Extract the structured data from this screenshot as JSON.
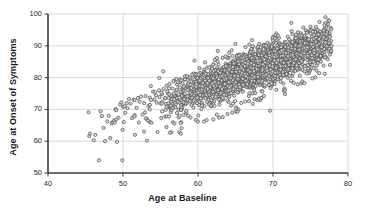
{
  "chart_data": {
    "type": "scatter",
    "title": "",
    "xlabel": "Age at Baseline",
    "ylabel": "Age at Onset of Symptoms",
    "xlim": [
      40,
      80
    ],
    "ylim": [
      50,
      100
    ],
    "xticks": [
      40,
      50,
      60,
      70,
      80
    ],
    "yticks": [
      50,
      60,
      70,
      80,
      90,
      100
    ],
    "grid": true,
    "legend": null,
    "marker": {
      "shape": "circle-open",
      "size_px": 3.2,
      "edge_color": "#555555",
      "fill_color": "#d8d8d8",
      "opacity": 0.85
    },
    "n_points": 2600,
    "point_cloud": {
      "x_range_observed": [
        45.0,
        77.8
      ],
      "y_range_observed": [
        54.0,
        99.2
      ],
      "correlation": 0.86,
      "dense_core_x": [
        57,
        77
      ],
      "dense_core_y": [
        74,
        96
      ]
    },
    "points": [
      [
        45.4,
        69.1
      ],
      [
        45.5,
        61.6
      ],
      [
        45.6,
        62.4
      ],
      [
        46.1,
        60.3
      ],
      [
        46.3,
        62.0
      ],
      [
        46.8,
        54.0
      ],
      [
        47.0,
        69.4
      ],
      [
        47.2,
        67.9
      ],
      [
        47.4,
        64.2
      ],
      [
        47.6,
        60.0
      ],
      [
        47.9,
        66.2
      ],
      [
        48.1,
        68.0
      ],
      [
        48.3,
        61.0
      ],
      [
        48.5,
        65.6
      ],
      [
        48.6,
        66.0
      ],
      [
        48.8,
        66.5
      ],
      [
        48.9,
        65.9
      ],
      [
        49.0,
        70.1
      ],
      [
        49.1,
        66.8
      ],
      [
        49.2,
        59.8
      ],
      [
        49.4,
        67.4
      ],
      [
        49.6,
        71.6
      ],
      [
        49.8,
        72.2
      ],
      [
        49.9,
        54.0
      ],
      [
        50.0,
        70.8
      ],
      [
        50.1,
        66.0
      ],
      [
        50.2,
        71.0
      ],
      [
        50.3,
        68.9
      ],
      [
        50.5,
        72.0
      ],
      [
        50.6,
        70.4
      ],
      [
        50.8,
        73.3
      ],
      [
        51.0,
        71.8
      ],
      [
        51.2,
        67.3
      ],
      [
        51.4,
        73.0
      ],
      [
        51.6,
        62.0
      ],
      [
        51.8,
        70.5
      ],
      [
        52.0,
        73.6
      ],
      [
        52.2,
        72.4
      ],
      [
        52.4,
        74.0
      ],
      [
        52.6,
        68.4
      ],
      [
        52.8,
        63.0
      ],
      [
        53.0,
        74.2
      ],
      [
        53.2,
        60.2
      ],
      [
        53.4,
        71.1
      ],
      [
        53.6,
        66.0
      ],
      [
        53.8,
        65.8
      ],
      [
        54.0,
        75.6
      ],
      [
        54.2,
        73.1
      ],
      [
        54.4,
        74.4
      ],
      [
        54.6,
        62.9
      ],
      [
        54.8,
        76.0
      ],
      [
        55.0,
        71.9
      ],
      [
        55.2,
        74.8
      ],
      [
        55.4,
        76.4
      ],
      [
        55.6,
        73.5
      ],
      [
        55.8,
        77.5
      ],
      [
        56.0,
        75.0
      ],
      [
        56.2,
        78.0
      ],
      [
        56.4,
        72.4
      ],
      [
        56.6,
        76.6
      ],
      [
        56.8,
        79.0
      ],
      [
        57.0,
        74.2
      ],
      [
        57.2,
        77.8
      ],
      [
        57.4,
        67.5
      ],
      [
        57.6,
        78.6
      ],
      [
        57.8,
        64.1
      ],
      [
        58.0,
        76.1
      ],
      [
        58.2,
        79.4
      ],
      [
        58.4,
        69.0
      ],
      [
        58.6,
        77.2
      ],
      [
        58.8,
        80.0
      ],
      [
        59.0,
        75.4
      ],
      [
        59.2,
        78.2
      ],
      [
        59.4,
        70.6
      ],
      [
        59.6,
        80.6
      ],
      [
        59.8,
        76.8
      ],
      [
        60.0,
        79.5
      ],
      [
        60.4,
        81.2
      ],
      [
        60.8,
        77.4
      ],
      [
        61.2,
        80.2
      ],
      [
        61.6,
        72.0
      ],
      [
        62.0,
        81.8
      ],
      [
        62.4,
        78.6
      ],
      [
        62.8,
        67.4
      ],
      [
        63.2,
        82.4
      ],
      [
        63.6,
        79.8
      ],
      [
        64.0,
        83.0
      ],
      [
        64.4,
        71.2
      ],
      [
        64.8,
        81.0
      ],
      [
        65.2,
        84.0
      ],
      [
        65.6,
        80.4
      ],
      [
        66.0,
        84.6
      ],
      [
        66.4,
        82.0
      ],
      [
        66.8,
        72.6
      ],
      [
        67.2,
        85.2
      ],
      [
        67.6,
        83.0
      ],
      [
        68.0,
        86.0
      ],
      [
        68.4,
        73.4
      ],
      [
        68.8,
        84.2
      ],
      [
        69.2,
        86.8
      ],
      [
        69.6,
        69.6
      ],
      [
        70.0,
        87.4
      ],
      [
        70.4,
        85.0
      ],
      [
        70.8,
        88.0
      ],
      [
        71.2,
        86.2
      ],
      [
        71.6,
        74.8
      ],
      [
        72.0,
        89.0
      ],
      [
        72.4,
        87.0
      ],
      [
        72.8,
        90.0
      ],
      [
        73.2,
        88.2
      ],
      [
        73.6,
        91.0
      ],
      [
        74.0,
        89.4
      ],
      [
        74.4,
        92.0
      ],
      [
        74.8,
        90.2
      ],
      [
        75.2,
        93.0
      ],
      [
        75.6,
        91.4
      ],
      [
        76.0,
        94.0
      ],
      [
        76.4,
        92.6
      ],
      [
        76.8,
        95.0
      ],
      [
        77.2,
        96.4
      ],
      [
        77.4,
        98.0
      ],
      [
        77.6,
        84.0
      ],
      [
        77.0,
        99.0
      ],
      [
        76.2,
        97.5
      ],
      [
        75.0,
        96.0
      ]
    ]
  },
  "axes": {
    "x_ticks": [
      "40",
      "50",
      "60",
      "70",
      "80"
    ],
    "y_ticks": [
      "50",
      "60",
      "70",
      "80",
      "90",
      "100"
    ],
    "x_title": "Age at Baseline",
    "y_title": "Age at Onset of Symptoms"
  },
  "colors": {
    "axis_line": "#3a3a3a",
    "grid_line": "#d9d9d9",
    "marker_edge": "#555555",
    "marker_fill": "#dcdcdc",
    "text": "#1a1a1a",
    "background": "#ffffff"
  }
}
